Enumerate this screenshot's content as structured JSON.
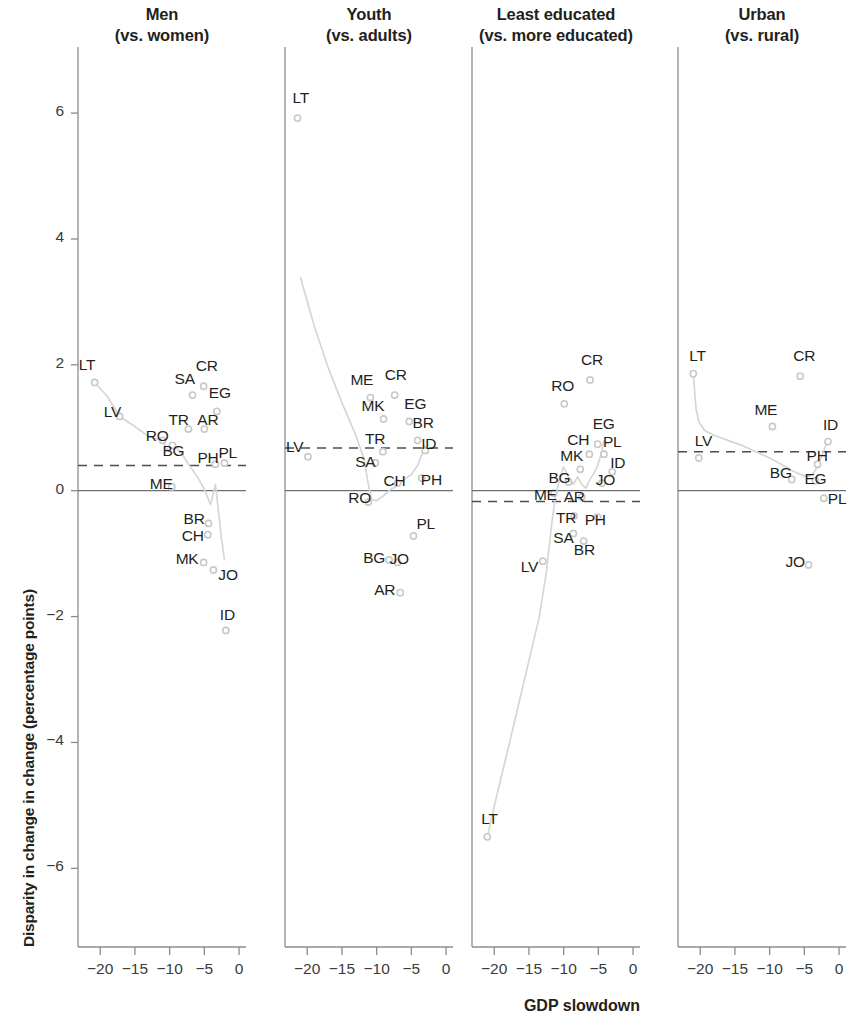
{
  "figure": {
    "xlabel": "GDP slowdown",
    "ylabel": "Disparity in change in change (percentage points)",
    "colors": {
      "text": "#231f20",
      "axis": "#8c8c8c",
      "point": "#c9c9c9",
      "connector": "#d6d6d6",
      "dashed": "#4d4d4d"
    }
  },
  "chart_data": {
    "type": "scatter",
    "title": "",
    "xlabel": "GDP slowdown",
    "ylabel": "Disparity in change in change (percentage points)",
    "xlim": [
      -23.5,
      1.5
    ],
    "ylim": [
      -7.2,
      7.0
    ],
    "xticks": [
      -20,
      -15,
      -10,
      -5,
      0
    ],
    "xtick_labels": [
      "−20",
      "−15",
      "−10",
      "−5",
      "0"
    ],
    "yticks": [
      -6,
      -4,
      -2,
      0,
      2,
      4,
      6
    ],
    "ytick_labels": [
      "−6",
      "−4",
      "−2",
      "0",
      "2",
      "4",
      "6"
    ],
    "grid": false,
    "legend": null,
    "zero_line": 0,
    "panels": [
      {
        "title_line1": "Men",
        "title_line2": "(vs. women)",
        "mean_line": 0.4,
        "points": [
          {
            "label": "LT",
            "x": -20.8,
            "y": 1.72,
            "label_dx": -16,
            "label_dy": -17
          },
          {
            "label": "LV",
            "x": -17.2,
            "y": 1.18,
            "label_dx": -16,
            "label_dy": -4
          },
          {
            "label": "RO",
            "x": -11.0,
            "y": 0.8,
            "label_dx": -17,
            "label_dy": -4
          },
          {
            "label": "BG",
            "x": -9.6,
            "y": 0.72,
            "label_dx": -10,
            "label_dy": 6
          },
          {
            "label": "SA",
            "x": -6.7,
            "y": 1.52,
            "label_dx": -18,
            "label_dy": -16
          },
          {
            "label": "CR",
            "x": -5.1,
            "y": 1.66,
            "label_dx": -8,
            "label_dy": -20
          },
          {
            "label": "TR",
            "x": -7.3,
            "y": 0.98,
            "label_dx": -20,
            "label_dy": -9
          },
          {
            "label": "AR",
            "x": -5.0,
            "y": 0.98,
            "label_dx": -7,
            "label_dy": -9
          },
          {
            "label": "EG",
            "x": -3.2,
            "y": 1.26,
            "label_dx": -8,
            "label_dy": -18
          },
          {
            "label": "PH",
            "x": -3.4,
            "y": 0.42,
            "label_dx": -18,
            "label_dy": -6
          },
          {
            "label": "PL",
            "x": -2.1,
            "y": 0.44,
            "label_dx": -6,
            "label_dy": -10
          },
          {
            "label": "ME",
            "x": -9.7,
            "y": 0.06,
            "label_dx": -22,
            "label_dy": -3
          },
          {
            "label": "BR",
            "x": -4.4,
            "y": -0.52,
            "label_dx": -25,
            "label_dy": -4
          },
          {
            "label": "CH",
            "x": -4.5,
            "y": -0.7,
            "label_dx": -26,
            "label_dy": 1
          },
          {
            "label": "MK",
            "x": -5.1,
            "y": -1.14,
            "label_dx": -28,
            "label_dy": -3
          },
          {
            "label": "JO",
            "x": -3.7,
            "y": -1.26,
            "label_dx": 5,
            "label_dy": 5
          },
          {
            "label": "ID",
            "x": -1.9,
            "y": -2.22,
            "label_dx": -6,
            "label_dy": -15
          }
        ],
        "connector": [
          [
            -20.8,
            1.72
          ],
          [
            -19.0,
            1.5
          ],
          [
            -17.2,
            1.18
          ],
          [
            -15.0,
            1.02
          ],
          [
            -13.0,
            0.86
          ],
          [
            -11.0,
            0.8
          ],
          [
            -10.2,
            0.62
          ],
          [
            -9.6,
            0.72
          ],
          [
            -8.4,
            0.62
          ],
          [
            -7.3,
            0.42
          ],
          [
            -6.0,
            0.22
          ],
          [
            -5.0,
            0.02
          ],
          [
            -4.1,
            -0.22
          ],
          [
            -3.4,
            0.1
          ],
          [
            -3.0,
            -0.28
          ],
          [
            -2.6,
            -0.7
          ],
          [
            -2.1,
            -1.1
          ]
        ]
      },
      {
        "title_line1": "Youth",
        "title_line2": "(vs. adults)",
        "mean_line": 0.68,
        "points": [
          {
            "label": "LT",
            "x": -21.4,
            "y": 5.92,
            "label_dx": -5,
            "label_dy": -20
          },
          {
            "label": "LV",
            "x": -19.9,
            "y": 0.54,
            "label_dx": -22,
            "label_dy": -10
          },
          {
            "label": "ME",
            "x": -10.9,
            "y": 1.48,
            "label_dx": -20,
            "label_dy": -18
          },
          {
            "label": "CR",
            "x": -7.4,
            "y": 1.52,
            "label_dx": -10,
            "label_dy": -20
          },
          {
            "label": "MK",
            "x": -9.0,
            "y": 1.14,
            "label_dx": -22,
            "label_dy": -13
          },
          {
            "label": "EG",
            "x": -5.3,
            "y": 1.1,
            "label_dx": -5,
            "label_dy": -17
          },
          {
            "label": "TR",
            "x": -9.1,
            "y": 0.62,
            "label_dx": -18,
            "label_dy": -13
          },
          {
            "label": "BR",
            "x": -4.1,
            "y": 0.8,
            "label_dx": -5,
            "label_dy": -17
          },
          {
            "label": "SA",
            "x": -10.2,
            "y": 0.44,
            "label_dx": -20,
            "label_dy": -1
          },
          {
            "label": "ID",
            "x": -3.0,
            "y": 0.64,
            "label_dx": -4,
            "label_dy": -6
          },
          {
            "label": "CH",
            "x": -7.0,
            "y": 0.12,
            "label_dx": -14,
            "label_dy": -2
          },
          {
            "label": "PH",
            "x": -3.5,
            "y": 0.2,
            "label_dx": -1,
            "label_dy": 2
          },
          {
            "label": "RO",
            "x": -11.2,
            "y": -0.18,
            "label_dx": -20,
            "label_dy": -4
          },
          {
            "label": "PL",
            "x": -4.7,
            "y": -0.72,
            "label_dx": 3,
            "label_dy": -12
          },
          {
            "label": "BG",
            "x": -8.2,
            "y": -1.1,
            "label_dx": -26,
            "label_dy": -2
          },
          {
            "label": "JO",
            "x": -7.0,
            "y": -1.14,
            "label_dx": -8,
            "label_dy": -3
          },
          {
            "label": "AR",
            "x": -6.6,
            "y": -1.62,
            "label_dx": -26,
            "label_dy": -3
          }
        ],
        "connector": [
          [
            -21.0,
            3.4
          ],
          [
            -19.0,
            2.62
          ],
          [
            -17.0,
            1.96
          ],
          [
            -15.0,
            1.4
          ],
          [
            -13.0,
            0.88
          ],
          [
            -11.8,
            0.5
          ],
          [
            -11.2,
            0.1
          ],
          [
            -10.7,
            -0.14
          ],
          [
            -10.0,
            -0.16
          ],
          [
            -9.0,
            -0.08
          ],
          [
            -8.0,
            0.02
          ],
          [
            -7.0,
            0.08
          ],
          [
            -6.0,
            0.18
          ],
          [
            -5.0,
            0.26
          ],
          [
            -4.1,
            0.4
          ],
          [
            -3.4,
            0.6
          ],
          [
            -3.0,
            0.72
          ]
        ]
      },
      {
        "title_line1": "Least educated",
        "title_line2": "(vs. more educated)",
        "mean_line": -0.17,
        "points": [
          {
            "label": "CR",
            "x": -6.2,
            "y": 1.76,
            "label_dx": -9,
            "label_dy": -20
          },
          {
            "label": "RO",
            "x": -9.9,
            "y": 1.38,
            "label_dx": -13,
            "label_dy": -18
          },
          {
            "label": "EG",
            "x": -5.1,
            "y": 0.74,
            "label_dx": -5,
            "label_dy": -20
          },
          {
            "label": "CH",
            "x": -6.3,
            "y": 0.58,
            "label_dx": -22,
            "label_dy": -14
          },
          {
            "label": "PL",
            "x": -4.2,
            "y": 0.58,
            "label_dx": -1,
            "label_dy": -12
          },
          {
            "label": "MK",
            "x": -7.6,
            "y": 0.34,
            "label_dx": -20,
            "label_dy": -13
          },
          {
            "label": "ID",
            "x": -3.0,
            "y": 0.3,
            "label_dx": -2,
            "label_dy": -9
          },
          {
            "label": "BG",
            "x": -9.3,
            "y": 0.14,
            "label_dx": -20,
            "label_dy": -4
          },
          {
            "label": "JO",
            "x": -4.5,
            "y": 0.12,
            "label_dx": -6,
            "label_dy": -3
          },
          {
            "label": "AR",
            "x": -7.4,
            "y": -0.1,
            "label_dx": -18,
            "label_dy": 0
          },
          {
            "label": "ME",
            "x": -11.4,
            "y": -0.04,
            "label_dx": -20,
            "label_dy": 2
          },
          {
            "label": "TR",
            "x": -8.5,
            "y": -0.4,
            "label_dx": -18,
            "label_dy": 2
          },
          {
            "label": "PH",
            "x": -5.1,
            "y": -0.42,
            "label_dx": -13,
            "label_dy": 3
          },
          {
            "label": "SA",
            "x": -8.6,
            "y": -0.68,
            "label_dx": -20,
            "label_dy": 4
          },
          {
            "label": "BR",
            "x": -7.1,
            "y": -0.8,
            "label_dx": -10,
            "label_dy": 9
          },
          {
            "label": "LV",
            "x": -13.0,
            "y": -1.12,
            "label_dx": -22,
            "label_dy": 6
          },
          {
            "label": "LT",
            "x": -21.0,
            "y": -5.5,
            "label_dx": -6,
            "label_dy": -18
          }
        ],
        "connector": [
          [
            -21.0,
            -5.5
          ],
          [
            -19.5,
            -4.78
          ],
          [
            -18.0,
            -4.1
          ],
          [
            -16.5,
            -3.4
          ],
          [
            -15.0,
            -2.7
          ],
          [
            -13.5,
            -2.0
          ],
          [
            -12.5,
            -1.3
          ],
          [
            -11.8,
            -0.6
          ],
          [
            -11.2,
            -0.1
          ],
          [
            -10.6,
            0.18
          ],
          [
            -10.0,
            0.38
          ],
          [
            -9.3,
            0.22
          ],
          [
            -8.6,
            0.1
          ],
          [
            -8.0,
            0.22
          ],
          [
            -7.4,
            0.1
          ],
          [
            -6.8,
            0.04
          ],
          [
            -6.2,
            0.18
          ],
          [
            -5.6,
            0.28
          ],
          [
            -5.1,
            0.4
          ],
          [
            -4.6,
            0.58
          ],
          [
            -4.2,
            0.8
          ]
        ]
      },
      {
        "title_line1": "Urban",
        "title_line2": "(vs. rural)",
        "mean_line": 0.62,
        "points": [
          {
            "label": "LT",
            "x": -21.0,
            "y": 1.86,
            "label_dx": -4,
            "label_dy": -18
          },
          {
            "label": "CR",
            "x": -5.6,
            "y": 1.82,
            "label_dx": -7,
            "label_dy": -20
          },
          {
            "label": "ME",
            "x": -9.6,
            "y": 1.02,
            "label_dx": -18,
            "label_dy": -17
          },
          {
            "label": "ID",
            "x": -1.6,
            "y": 0.78,
            "label_dx": -5,
            "label_dy": -17
          },
          {
            "label": "LV",
            "x": -20.2,
            "y": 0.52,
            "label_dx": -4,
            "label_dy": -17
          },
          {
            "label": "PH",
            "x": -3.1,
            "y": 0.42,
            "label_dx": -11,
            "label_dy": -8
          },
          {
            "label": "BG",
            "x": -6.8,
            "y": 0.18,
            "label_dx": -22,
            "label_dy": -6
          },
          {
            "label": "EG",
            "x": -3.4,
            "y": 0.16,
            "label_dx": -11,
            "label_dy": -2
          },
          {
            "label": "PL",
            "x": -2.2,
            "y": -0.12,
            "label_dx": 4,
            "label_dy": 1
          },
          {
            "label": "JO",
            "x": -4.4,
            "y": -1.18,
            "label_dx": -23,
            "label_dy": -3
          }
        ],
        "connector": [
          [
            -21.0,
            1.86
          ],
          [
            -20.6,
            1.3
          ],
          [
            -20.2,
            1.1
          ],
          [
            -19.4,
            0.96
          ],
          [
            -18.0,
            0.88
          ],
          [
            -16.0,
            0.8
          ],
          [
            -14.0,
            0.72
          ],
          [
            -12.0,
            0.62
          ],
          [
            -10.0,
            0.52
          ],
          [
            -8.0,
            0.4
          ],
          [
            -6.8,
            0.32
          ],
          [
            -5.6,
            0.26
          ],
          [
            -4.6,
            0.22
          ],
          [
            -3.8,
            0.26
          ],
          [
            -3.1,
            0.38
          ],
          [
            -2.4,
            0.58
          ],
          [
            -1.6,
            0.8
          ]
        ]
      }
    ]
  }
}
